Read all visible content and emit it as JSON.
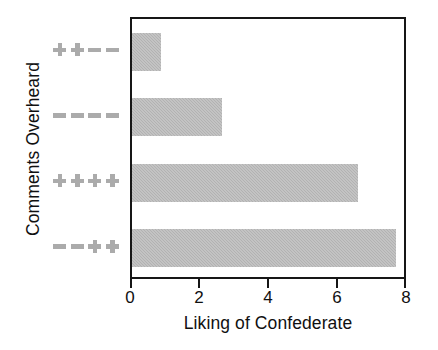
{
  "chart_data": {
    "type": "bar",
    "orientation": "horizontal",
    "title": "",
    "xlabel": "Liking of Confederate",
    "ylabel": "Comments Overheard",
    "categories": [
      "++--",
      "----",
      "++++",
      "--++"
    ],
    "category_symbols": [
      [
        "plus",
        "plus",
        "minus",
        "minus"
      ],
      [
        "minus",
        "minus",
        "minus",
        "minus"
      ],
      [
        "plus",
        "plus",
        "plus",
        "plus"
      ],
      [
        "minus",
        "minus",
        "plus",
        "plus"
      ]
    ],
    "values": [
      0.85,
      2.6,
      6.55,
      7.65
    ],
    "xlim": [
      0,
      8
    ],
    "xticks": [
      0,
      2,
      4,
      6,
      8
    ],
    "xtick_labels": [
      "0",
      "2",
      "4",
      "6",
      "8"
    ],
    "grid": false,
    "legend": false,
    "bar_color": "#b2b2b2",
    "axis_color": "#161616",
    "label_color": "#ababab",
    "text_color": "#101010",
    "background": "#ffffff"
  }
}
